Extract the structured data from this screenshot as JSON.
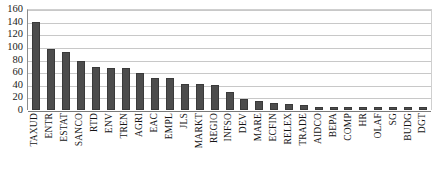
{
  "chart_data": {
    "type": "bar",
    "title": "",
    "subtitle": "",
    "xlabel": "",
    "ylabel": "",
    "ylim": [
      0,
      160
    ],
    "ytick_step": 20,
    "yticks": [
      160,
      140,
      120,
      100,
      80,
      60,
      40,
      20,
      0
    ],
    "grid": true,
    "legend": false,
    "legend_position": "none",
    "bar_color": "#4d4d4d",
    "categories": [
      "TAXUD",
      "ENTR",
      "ESTAT",
      "SANCO",
      "RTD",
      "ENV",
      "TREN",
      "AGRI",
      "EAC",
      "EMPL",
      "JLS",
      "MARKT",
      "REGIO",
      "INFSO",
      "DEV",
      "MARE",
      "ECFIN",
      "RELEX",
      "TRADE",
      "AIDCO",
      "BEPA",
      "COMP",
      "HR",
      "OLAF",
      "SG",
      "BUDG",
      "DGT"
    ],
    "values": [
      139,
      96,
      92,
      77,
      68,
      67,
      67,
      58,
      50,
      50,
      42,
      42,
      40,
      29,
      17,
      14,
      11,
      9,
      8,
      5,
      5,
      5,
      4,
      5,
      4,
      5,
      4
    ]
  }
}
